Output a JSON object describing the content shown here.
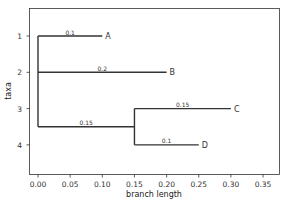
{
  "chart_data": {
    "type": "tree",
    "title": "",
    "xlabel": "branch length",
    "ylabel": "taxa",
    "xlim": [
      -0.0175,
      0.375
    ],
    "ylim": [
      4.8,
      0.25
    ],
    "grid": false,
    "xticks": [
      "0.00",
      "0.05",
      "0.10",
      "0.15",
      "0.20",
      "0.25",
      "0.30",
      "0.35"
    ],
    "xtick_values": [
      0,
      0.05,
      0.1,
      0.15,
      0.2,
      0.25,
      0.3,
      0.35
    ],
    "yticks": [
      "1",
      "2",
      "3",
      "4"
    ],
    "yticks_values": [
      1,
      2,
      3,
      4
    ],
    "leaves": [
      {
        "name": "A",
        "y": 1,
        "x_start": 0.0,
        "x_end": 0.1,
        "branch_label": "0.1"
      },
      {
        "name": "B",
        "y": 2,
        "x_start": 0.0,
        "x_end": 0.2,
        "branch_label": "0.2"
      },
      {
        "name": "C",
        "y": 3,
        "x_start": 0.15,
        "x_end": 0.3,
        "branch_label": "0.15"
      },
      {
        "name": "D",
        "y": 4,
        "x_start": 0.15,
        "x_end": 0.25,
        "branch_label": "0.1"
      }
    ],
    "internal_branches": [
      {
        "y": 3.5,
        "x_start": 0.0,
        "x_end": 0.15,
        "branch_label": "0.15"
      }
    ],
    "vertical_connectors": [
      {
        "x": 0.0,
        "y_start": 1,
        "y_end": 3.5
      },
      {
        "x": 0.15,
        "y_start": 3,
        "y_end": 4
      }
    ]
  }
}
